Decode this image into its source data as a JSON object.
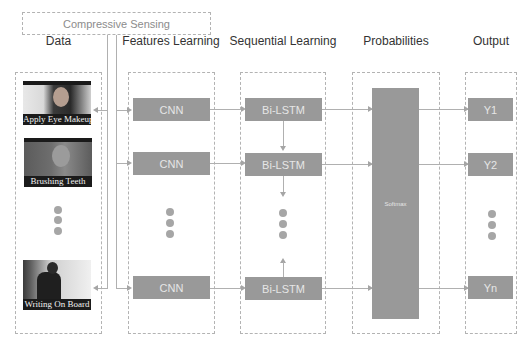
{
  "diagram": {
    "compressive_sensing": "Compressive Sensing",
    "columns": [
      {
        "id": "data",
        "heading": "Data"
      },
      {
        "id": "features",
        "heading": "Features Learning"
      },
      {
        "id": "sequential",
        "heading": "Sequential Learning"
      },
      {
        "id": "probabilities",
        "heading": "Probabilities"
      },
      {
        "id": "output",
        "heading": "Output"
      }
    ],
    "data_items": [
      {
        "caption": "Apply Eye Makeup"
      },
      {
        "caption": "Brushing Teeth"
      },
      {
        "caption": "Writing On Board"
      }
    ],
    "cnn_blocks": [
      "CNN",
      "CNN",
      "CNN"
    ],
    "bilstm_blocks": [
      "Bi-LSTM",
      "Bi-LSTM",
      "Bi-LSTM"
    ],
    "softmax_label": "Softmax",
    "outputs": [
      "Y1",
      "Y2",
      "Yn"
    ],
    "colors": {
      "block_fill": "#999999",
      "block_text": "#e6e6e6",
      "dashed_border": "#b3b3b3",
      "arrow": "#a5a5a5",
      "dot": "#a6a6a6"
    }
  }
}
